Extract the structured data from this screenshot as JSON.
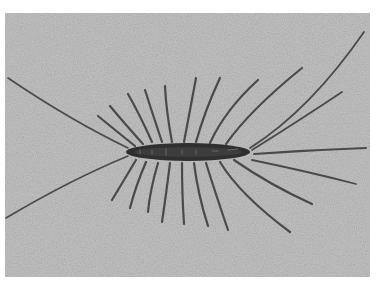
{
  "image": {
    "subject": "house centipede",
    "style": "grayscale photograph",
    "background_color": "#b4b4b4",
    "body_color": "#2f2f2f",
    "leg_color": "#4a4a4a"
  }
}
